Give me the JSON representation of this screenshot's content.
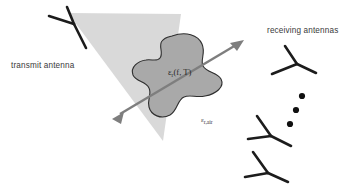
{
  "figure": {
    "background_color": "#ffffff"
  },
  "labels": {
    "transmit_antenna": "transmit antenna",
    "receiving_antennas": "receiving antennas",
    "sample_permittivity": "εr(f, T)",
    "sample_permittivity_base": "ε",
    "sample_permittivity_sub": "r",
    "sample_permittivity_args": "(f, T)",
    "air_permittivity_base": "ε",
    "air_permittivity_sub": "r,air"
  },
  "colors": {
    "beam_cone": "#d9d9d9",
    "sample_fill": "#a9a9a9",
    "sample_outline": "#2e2e2e",
    "antenna_stroke": "#1c1c1c",
    "arrow": "#7e7e7e",
    "label_text": "#3a3a3a",
    "dot": "#101010"
  },
  "geometry": {
    "beam_cone_points": "68,13 181,14 163,141",
    "sample_blob_path": "M 172,36 C 186,31 198,35 202,44 C 206,53 200,60 203,66 C 207,73 217,72 221,79 C 225,87 216,94 205,96 C 196,98 190,94 184,97 C 177,100 178,110 170,115 C 161,120 151,115 149,107 C 147,99 152,94 149,88 C 146,81 136,82 133,75 C 130,67 138,61 146,60 C 152,59 157,62 160,58 C 164,53 158,46 162,41 C 165,37 168,37 172,36 Z",
    "arrow_line": "M 120,114 L 236,45",
    "arrow_head_start": "112,119 124,112 121,124",
    "arrow_head_end": "244,40 230,43 237,51",
    "transmit_antenna": {
      "center": [
        74,
        24
      ],
      "arms": [
        "M 74,24 L 49,16",
        "M 74,24 L 67,7",
        "M 74,24 L 86,48"
      ]
    },
    "receiving_antennas": [
      {
        "center": [
          297,
          64
        ],
        "arms": [
          "M 297,64 L 272,74",
          "M 297,64 L 285,46",
          "M 297,64 L 316,73"
        ]
      },
      {
        "center": [
          271,
          136
        ],
        "arms": [
          "M 271,136 L 248,139",
          "M 271,136 L 257,116",
          "M 271,136 L 291,146"
        ]
      },
      {
        "center": [
          268,
          173
        ],
        "arms": [
          "M 268,173 L 245,177",
          "M 268,173 L 253,152",
          "M 268,173 L 288,182"
        ]
      }
    ],
    "ellipsis_dots": [
      {
        "cx": 302,
        "cy": 96,
        "r": 3.1
      },
      {
        "cx": 296,
        "cy": 110,
        "r": 3.1
      },
      {
        "cx": 290,
        "cy": 124,
        "r": 3.1
      }
    ],
    "label_positions": {
      "transmit_antenna": [
        11,
        68
      ],
      "receiving_antennas": [
        267,
        33
      ],
      "sample_permittivity": [
        168,
        75
      ],
      "air_permittivity": [
        201,
        122
      ]
    }
  }
}
